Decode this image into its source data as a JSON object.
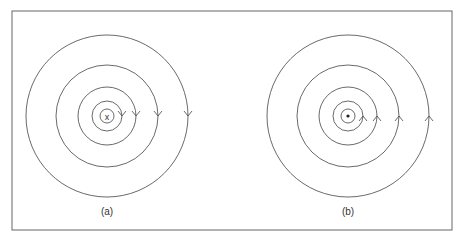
{
  "figure": {
    "panels": [
      {
        "label": "(a)",
        "center_symbol": "x",
        "center_meaning": "into-page",
        "arrow_direction": "down",
        "circle_count": 5
      },
      {
        "label": "(b)",
        "center_symbol": "•",
        "center_meaning": "out-of-page",
        "arrow_direction": "up",
        "circle_count": 5
      }
    ],
    "colors": {
      "line": "#444444",
      "border": "#666666",
      "background": "#ffffff"
    }
  }
}
